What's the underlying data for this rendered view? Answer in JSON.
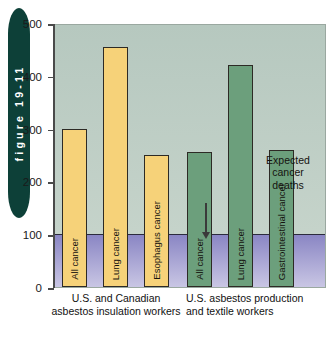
{
  "figure": {
    "tab_label": "figure 19-11"
  },
  "chart_data": {
    "type": "bar",
    "title": "",
    "xlabel": "",
    "ylabel": "",
    "ylim": [
      0,
      500
    ],
    "yticks": [
      0,
      100,
      200,
      300,
      400,
      500
    ],
    "ytick_labels": [
      "0",
      "100",
      "200",
      "300",
      "400",
      "500"
    ],
    "grid": false,
    "legend": "none",
    "groups": [
      {
        "caption": "U.S. and Canadian asbestos insulation workers",
        "color": "#f6d279",
        "bars": [
          {
            "label": "All cancer",
            "value": 300
          },
          {
            "label": "Lung cancer",
            "value": 455
          },
          {
            "label": "Esophagus cancer",
            "value": 250
          }
        ]
      },
      {
        "caption": "U.S. asbestos production and textile workers",
        "color": "#6c9f7c",
        "bars": [
          {
            "label": "All cancer",
            "value": 255
          },
          {
            "label": "Lung cancer",
            "value": 420
          },
          {
            "label": "Gastrointestinal cancer",
            "value": 260
          }
        ]
      }
    ],
    "annotations": [
      {
        "text": "Expected cancer deaths",
        "value": 100,
        "arrow": "down"
      }
    ],
    "reference_band": {
      "label": "Expected cancer deaths",
      "from": 0,
      "to": 100,
      "color": "#8a86c4"
    }
  },
  "colors": {
    "tab": "#0d4038",
    "plot_bg": "#c0cfc6",
    "band": "#9a96cf",
    "bar_yellow": "#f6d279",
    "bar_green": "#6c9f7c",
    "axis": "#4a4a4a"
  }
}
